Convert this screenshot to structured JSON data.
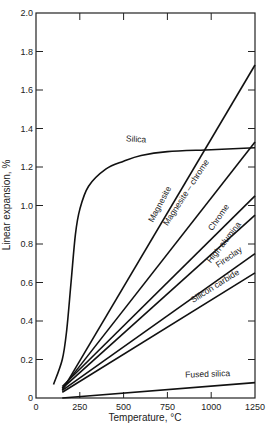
{
  "chart_data": {
    "type": "line",
    "title": "",
    "xlabel": "Temperature, °C",
    "ylabel": "Linear expansion, %",
    "xlim": [
      0,
      1250
    ],
    "ylim": [
      0,
      2.0
    ],
    "x_ticks": [
      0,
      250,
      500,
      750,
      1000,
      1250
    ],
    "x_tick_labels": [
      "0",
      "250",
      "500",
      "750",
      "1000",
      "1250"
    ],
    "y_ticks": [
      0,
      0.2,
      0.4,
      0.6,
      0.8,
      1.0,
      1.2,
      1.4,
      1.6,
      1.8,
      2.0
    ],
    "y_tick_labels": [
      "0",
      "0.2",
      "0.4",
      "0.6",
      "0.8",
      "1.0",
      "1.2",
      "1.4",
      "1.6",
      "1.8",
      "2.0"
    ],
    "grid": false,
    "legend": "inline labels",
    "series": [
      {
        "name": "Silica",
        "x": [
          100,
          150,
          175,
          200,
          225,
          250,
          300,
          400,
          500,
          600,
          750,
          1000,
          1250
        ],
        "values": [
          0.07,
          0.2,
          0.35,
          0.6,
          0.85,
          0.98,
          1.1,
          1.19,
          1.23,
          1.26,
          1.28,
          1.29,
          1.3
        ],
        "label_pos": {
          "x": 570,
          "y": 1.33,
          "angle": 4
        }
      },
      {
        "name": "Magnesite",
        "x": [
          150,
          1250
        ],
        "values": [
          0.04,
          1.73
        ],
        "label_pos": {
          "x": 720,
          "y": 1.0,
          "angle": -62
        }
      },
      {
        "name": "Magnesite – chrome",
        "x": [
          150,
          1250
        ],
        "values": [
          0.05,
          1.33
        ],
        "label_pos": {
          "x": 870,
          "y": 1.06,
          "angle": -57
        }
      },
      {
        "name": "Chrome",
        "x": [
          150,
          1250
        ],
        "values": [
          0.06,
          1.05
        ],
        "label_pos": {
          "x": 1055,
          "y": 0.93,
          "angle": -55
        }
      },
      {
        "name": "High alumina",
        "x": [
          150,
          1250
        ],
        "values": [
          0.05,
          0.95
        ],
        "label_pos": {
          "x": 1085,
          "y": 0.8,
          "angle": -52
        }
      },
      {
        "name": "Fireclay",
        "x": [
          150,
          1250
        ],
        "values": [
          0.04,
          0.75
        ],
        "label_pos": {
          "x": 1110,
          "y": 0.72,
          "angle": -35
        }
      },
      {
        "name": "Silicon carbide",
        "x": [
          150,
          1250
        ],
        "values": [
          0.03,
          0.65
        ],
        "label_pos": {
          "x": 1030,
          "y": 0.57,
          "angle": -32
        }
      },
      {
        "name": "Fused silica",
        "x": [
          150,
          1250
        ],
        "values": [
          0.0,
          0.08
        ],
        "label_pos": {
          "x": 980,
          "y": 0.11,
          "angle": -2
        }
      }
    ]
  }
}
